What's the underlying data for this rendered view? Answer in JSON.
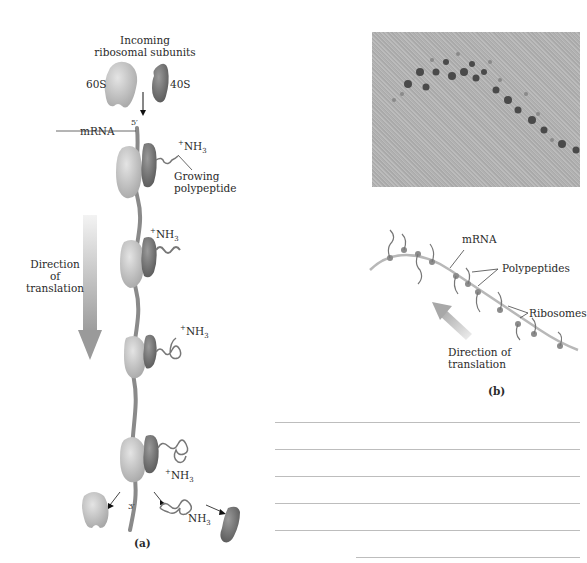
{
  "figure_a": {
    "title": "Incoming",
    "title2": "ribosomal subunits",
    "subunit_large": "60S",
    "subunit_small": "40S",
    "five_prime": "5′",
    "three_prime": "3′",
    "mrna": "mRNA",
    "nh3": "NH",
    "nh3_sub": "3",
    "plus": "+",
    "growing1": "Growing",
    "growing2": "polypeptide",
    "direction1": "Direction",
    "direction2": "of",
    "direction3": "translation",
    "caption": "(a)"
  },
  "figure_b": {
    "mrna": "mRNA",
    "polypeptides": "Polypeptides",
    "ribosomes": "Ribosomes",
    "direction1": "Direction of",
    "direction2": "translation",
    "caption": "(b)"
  },
  "colors": {
    "large_subunit": "#c8c8c8",
    "small_subunit": "#7a7a7a",
    "mrna_strand": "#8a8a8a",
    "arrow_gradient": "#b0b0b0",
    "rule_line": "#bdbdbd"
  },
  "answer_lines": 6
}
